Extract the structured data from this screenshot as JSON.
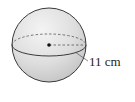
{
  "diagram": {
    "shape": "sphere",
    "radius_label": "11 cm",
    "colors": {
      "fill_light": "#f2f2f2",
      "fill_dark": "#c8c8c8",
      "stroke": "#3a3a3a"
    }
  }
}
